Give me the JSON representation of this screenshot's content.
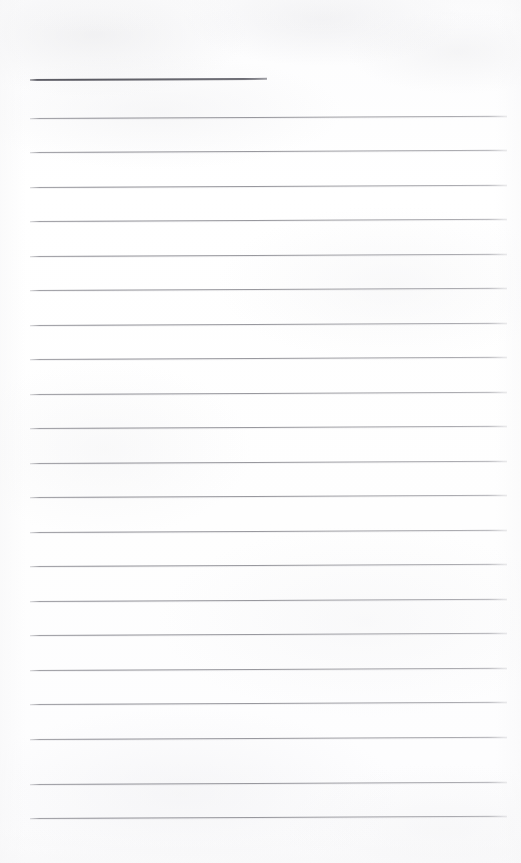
{
  "document": {
    "kind": "scanned-lined-paper",
    "title": "Blank Lined Notepad Page",
    "page_width": 521,
    "page_height": 863,
    "background_color": "#fdfdfd",
    "orientation": "portrait",
    "content_text": "",
    "visible_text": ""
  },
  "ruling": {
    "rule_color": "#92929a",
    "header_rule_color": "#5a5a62",
    "left_margin_x": 30,
    "right_margin_x": 507,
    "line_spacing": 34.5,
    "tilt_degrees": -0.28,
    "rule_count": 21,
    "header_rule": {
      "name": "header-rule",
      "y": 79,
      "x_start": 30,
      "x_end": 267,
      "thickness": 2,
      "color": "#5a5a62"
    },
    "rules": [
      {
        "y": 118,
        "x_start": 30,
        "x_end": 507
      },
      {
        "y": 152,
        "x_start": 30,
        "x_end": 507
      },
      {
        "y": 187,
        "x_start": 30,
        "x_end": 507
      },
      {
        "y": 221,
        "x_start": 30,
        "x_end": 507
      },
      {
        "y": 256,
        "x_start": 30,
        "x_end": 507
      },
      {
        "y": 290,
        "x_start": 30,
        "x_end": 507
      },
      {
        "y": 325,
        "x_start": 30,
        "x_end": 507
      },
      {
        "y": 359,
        "x_start": 30,
        "x_end": 507
      },
      {
        "y": 394,
        "x_start": 30,
        "x_end": 507
      },
      {
        "y": 428,
        "x_start": 30,
        "x_end": 507
      },
      {
        "y": 463,
        "x_start": 30,
        "x_end": 507
      },
      {
        "y": 497,
        "x_start": 30,
        "x_end": 507
      },
      {
        "y": 532,
        "x_start": 30,
        "x_end": 507
      },
      {
        "y": 566,
        "x_start": 30,
        "x_end": 507
      },
      {
        "y": 601,
        "x_start": 30,
        "x_end": 507
      },
      {
        "y": 635,
        "x_start": 30,
        "x_end": 507
      },
      {
        "y": 670,
        "x_start": 30,
        "x_end": 507
      },
      {
        "y": 704,
        "x_start": 30,
        "x_end": 507
      },
      {
        "y": 739,
        "x_start": 30,
        "x_end": 507
      },
      {
        "y": 784,
        "x_start": 30,
        "x_end": 507
      },
      {
        "y": 818,
        "x_start": 30,
        "x_end": 507
      }
    ]
  }
}
